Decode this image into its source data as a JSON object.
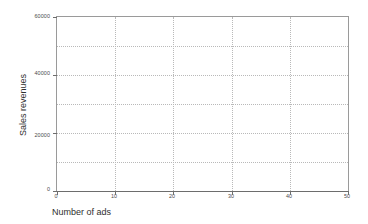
{
  "chart_data": {
    "type": "scatter",
    "title": "",
    "xlabel": "Number of ads",
    "ylabel": "Sales revenues",
    "xlim": [
      0,
      50
    ],
    "ylim": [
      0,
      60000
    ],
    "grid": true,
    "legend": null,
    "series": [
      {
        "name": "Sales revenues vs Number of ads",
        "x": [],
        "y": []
      }
    ],
    "x_ticks": [
      {
        "value": 0,
        "label": "0"
      },
      {
        "value": 10,
        "label": "10"
      },
      {
        "value": 20,
        "label": "20"
      },
      {
        "value": 30,
        "label": "30"
      },
      {
        "value": 40,
        "label": "40"
      },
      {
        "value": 50,
        "label": "50"
      }
    ],
    "y_ticks": [
      {
        "value": 0,
        "label": "0"
      },
      {
        "value": 20000,
        "label": "20000"
      },
      {
        "value": 40000,
        "label": "40000"
      },
      {
        "value": 60000,
        "label": "60000"
      }
    ],
    "x_gridlines": [
      10,
      20,
      30,
      40
    ],
    "y_gridlines": [
      10000,
      20000,
      30000,
      40000,
      50000
    ],
    "colors": {
      "background": "#ffffff",
      "frame": "#9a9a9a",
      "axis": "#6d6d6d",
      "gridline": "#b9b9b9",
      "tick_label": "#4a4a4a",
      "axis_title": "#2f2f2f"
    }
  }
}
